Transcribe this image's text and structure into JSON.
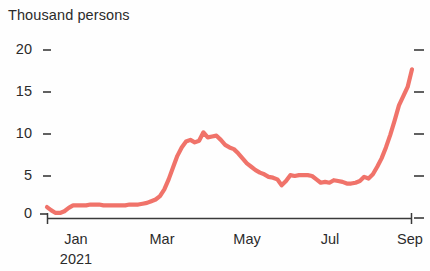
{
  "chart_data": {
    "type": "line",
    "title": "Thousand persons",
    "subtitle": "",
    "xlabel": "",
    "ylabel": "Thousand persons",
    "unit_label": "Thousand persons",
    "grid": false,
    "legend": null,
    "legend_position": "none",
    "line_color": "#f0736a",
    "axis_color": "#3a3a3a",
    "background_color": "#ffffff",
    "ylim": [
      0,
      20
    ],
    "yticks": [
      0,
      5,
      10,
      15,
      20
    ],
    "ytick_labels": [
      "0",
      "5",
      "10",
      "15",
      "20"
    ],
    "right_axis_ticks": [
      0,
      5,
      10,
      15,
      20
    ],
    "right_axis_tick_labels": [
      "",
      "",
      "",
      "",
      ""
    ],
    "xlim": [
      "2021-01-01",
      "2021-09-10"
    ],
    "xticks": [
      "Jan",
      "Mar",
      "May",
      "Jul",
      "Sep"
    ],
    "xtick_labels": [
      "Jan",
      "Mar",
      "May",
      "Jul",
      "Sep"
    ],
    "xtick_sublabels": [
      "2021",
      "",
      "",
      "",
      ""
    ],
    "x_axis_year": "2021",
    "series": [
      {
        "name": "Thousand persons",
        "color": "#f0736a",
        "x": [
          "2021-01-01",
          "2021-01-04",
          "2021-01-07",
          "2021-01-10",
          "2021-01-13",
          "2021-01-16",
          "2021-01-19",
          "2021-01-22",
          "2021-01-25",
          "2021-01-28",
          "2021-01-31",
          "2021-02-03",
          "2021-02-06",
          "2021-02-09",
          "2021-02-12",
          "2021-02-15",
          "2021-02-18",
          "2021-02-21",
          "2021-02-24",
          "2021-02-27",
          "2021-03-02",
          "2021-03-05",
          "2021-03-08",
          "2021-03-11",
          "2021-03-14",
          "2021-03-17",
          "2021-03-20",
          "2021-03-23",
          "2021-03-26",
          "2021-03-29",
          "2021-04-01",
          "2021-04-04",
          "2021-04-07",
          "2021-04-10",
          "2021-04-13",
          "2021-04-16",
          "2021-04-19",
          "2021-04-22",
          "2021-04-25",
          "2021-04-28",
          "2021-05-01",
          "2021-05-04",
          "2021-05-07",
          "2021-05-10",
          "2021-05-13",
          "2021-05-16",
          "2021-05-19",
          "2021-05-22",
          "2021-05-25",
          "2021-05-28",
          "2021-05-31",
          "2021-06-03",
          "2021-06-06",
          "2021-06-09",
          "2021-06-12",
          "2021-06-15",
          "2021-06-18",
          "2021-06-21",
          "2021-06-24",
          "2021-06-27",
          "2021-06-30",
          "2021-07-03",
          "2021-07-06",
          "2021-07-09",
          "2021-07-12",
          "2021-07-15",
          "2021-07-18",
          "2021-07-21",
          "2021-07-24",
          "2021-07-27",
          "2021-07-30",
          "2021-08-02",
          "2021-08-05",
          "2021-08-08",
          "2021-08-11",
          "2021-08-14",
          "2021-08-17",
          "2021-08-20",
          "2021-08-23",
          "2021-08-26",
          "2021-08-29",
          "2021-09-01",
          "2021-09-04",
          "2021-09-07"
        ],
        "values": [
          1.3,
          0.9,
          0.6,
          0.6,
          0.8,
          1.2,
          1.5,
          1.5,
          1.5,
          1.5,
          1.6,
          1.6,
          1.6,
          1.5,
          1.5,
          1.5,
          1.5,
          1.5,
          1.5,
          1.6,
          1.6,
          1.6,
          1.7,
          1.8,
          2.0,
          2.2,
          2.6,
          3.4,
          4.6,
          6.0,
          7.4,
          8.4,
          9.1,
          9.3,
          9.0,
          9.2,
          10.2,
          9.6,
          9.7,
          9.8,
          9.3,
          8.7,
          8.4,
          8.2,
          7.7,
          7.1,
          6.5,
          6.1,
          5.7,
          5.4,
          5.2,
          4.9,
          4.8,
          4.6,
          3.9,
          4.4,
          5.1,
          5.0,
          5.1,
          5.1,
          5.1,
          5.0,
          4.6,
          4.2,
          4.3,
          4.2,
          4.5,
          4.4,
          4.3,
          4.1,
          4.1,
          4.2,
          4.4,
          4.9,
          4.7,
          5.2,
          6.1,
          7.1,
          8.4,
          9.9,
          11.6,
          13.4,
          14.5,
          15.6
        ],
        "final_value": 17.7,
        "peak_value": 10.2,
        "min_value": 0.6
      }
    ]
  },
  "axis_geometry": {
    "plot_left": 47,
    "plot_right": 412,
    "y_zero_px": 218,
    "y_top_px": 50
  }
}
